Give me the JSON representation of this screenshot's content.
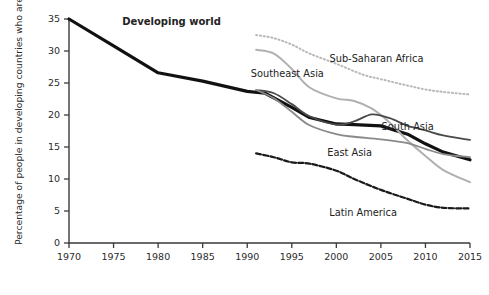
{
  "chart_data": {
    "type": "line",
    "title": "",
    "xlabel": "",
    "ylabel": "Percentage of people in developing countries who are undernourished",
    "xlim": [
      1970,
      2015
    ],
    "ylim": [
      0,
      35
    ],
    "grid": false,
    "legend_position": "inline-labels",
    "xticks": [
      "1970",
      "1975",
      "1980",
      "1985",
      "1990",
      "1995",
      "2000",
      "2005",
      "2010",
      "2015"
    ],
    "yticks": [
      "0",
      "5",
      "10",
      "15",
      "20",
      "25",
      "30",
      "35"
    ],
    "series": [
      {
        "name": "Developing world",
        "style": "solid-thick-black",
        "color": "#111111",
        "x": [
          1970,
          1975,
          1980,
          1985,
          1990,
          1992,
          1995,
          1997,
          2000,
          2002,
          2005,
          2008,
          2010,
          2012,
          2015
        ],
        "values": [
          35.0,
          30.8,
          26.6,
          25.3,
          23.7,
          23.4,
          21.2,
          19.6,
          18.6,
          18.5,
          18.3,
          17.0,
          15.5,
          14.2,
          13.0
        ]
      },
      {
        "name": "Sub-Saharan Africa",
        "style": "dotted-light-gray",
        "color": "#b9b9b9",
        "x": [
          1991,
          1993,
          1995,
          1997,
          2000,
          2003,
          2005,
          2008,
          2010,
          2012,
          2015
        ],
        "values": [
          32.5,
          32.0,
          31.0,
          29.6,
          28.0,
          26.3,
          25.6,
          24.6,
          24.0,
          23.6,
          23.2
        ]
      },
      {
        "name": "Southeast Asia",
        "style": "solid-light-gray",
        "color": "#b0b0b0",
        "x": [
          1991,
          1993,
          1995,
          1997,
          2000,
          2002,
          2004,
          2006,
          2008,
          2010,
          2012,
          2015
        ],
        "values": [
          30.2,
          29.6,
          27.2,
          24.3,
          22.6,
          22.2,
          21.0,
          18.8,
          16.0,
          13.6,
          11.4,
          9.5
        ]
      },
      {
        "name": "South Asia",
        "style": "solid-dark-gray",
        "color": "#4a4a4a",
        "x": [
          1991,
          1993,
          1995,
          1997,
          2000,
          2002,
          2004,
          2006,
          2008,
          2010,
          2012,
          2015
        ],
        "values": [
          23.9,
          23.4,
          21.7,
          19.8,
          18.5,
          19.0,
          20.1,
          19.5,
          18.3,
          17.6,
          16.8,
          16.1
        ]
      },
      {
        "name": "East Asia",
        "style": "solid-mid-gray",
        "color": "#8a8a8a",
        "x": [
          1991,
          1993,
          1995,
          1997,
          2000,
          2002,
          2005,
          2008,
          2010,
          2012,
          2015
        ],
        "values": [
          23.9,
          22.6,
          20.5,
          18.4,
          17.0,
          16.6,
          16.2,
          15.6,
          14.7,
          13.9,
          13.4
        ]
      },
      {
        "name": "Latin America",
        "style": "dashed-black",
        "color": "#1a1a1a",
        "x": [
          1991,
          1993,
          1995,
          1997,
          2000,
          2002,
          2005,
          2008,
          2010,
          2012,
          2015
        ],
        "values": [
          14.0,
          13.4,
          12.6,
          12.4,
          11.3,
          10.0,
          8.3,
          6.9,
          6.0,
          5.5,
          5.4
        ]
      }
    ],
    "annotations": [
      {
        "text": "Developing world",
        "x": 1981.5,
        "y": 34.0,
        "bold": true
      },
      {
        "text": "Sub-Saharan Africa",
        "x": 2004.5,
        "y": 28.3,
        "bold": false
      },
      {
        "text": "Southeast Asia",
        "x": 1994.5,
        "y": 26.0,
        "bold": false
      },
      {
        "text": "South Asia",
        "x": 2008.0,
        "y": 17.6,
        "bold": false
      },
      {
        "text": "East Asia",
        "x": 2001.5,
        "y": 13.6,
        "bold": false
      },
      {
        "text": "Latin America",
        "x": 2003.0,
        "y": 4.2,
        "bold": false
      }
    ]
  }
}
